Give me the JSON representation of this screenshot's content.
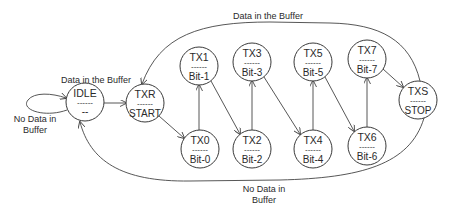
{
  "diagram": {
    "type": "state-machine",
    "nodes": [
      {
        "id": "IDLE",
        "label": "IDLE",
        "sub": "--",
        "sep": "------",
        "cx": 85,
        "cy": 102
      },
      {
        "id": "TXR",
        "label": "TXR",
        "sub": "START",
        "sep": "------",
        "cx": 145,
        "cy": 103
      },
      {
        "id": "TX0",
        "label": "TX0",
        "sub": "Bit-0",
        "sep": "------",
        "cx": 200,
        "cy": 149
      },
      {
        "id": "TX1",
        "label": "TX1",
        "sub": "Bit-1",
        "sep": "------",
        "cx": 199,
        "cy": 66
      },
      {
        "id": "TX2",
        "label": "TX2",
        "sub": "Bit-2",
        "sep": "------",
        "cx": 252,
        "cy": 149
      },
      {
        "id": "TX3",
        "label": "TX3",
        "sub": "Bit-3",
        "sep": "------",
        "cx": 252,
        "cy": 62
      },
      {
        "id": "TX4",
        "label": "TX4",
        "sub": "Bit-4",
        "sep": "------",
        "cx": 313,
        "cy": 149
      },
      {
        "id": "TX5",
        "label": "TX5",
        "sub": "Bit-5",
        "sep": "------",
        "cx": 313,
        "cy": 62
      },
      {
        "id": "TX6",
        "label": "TX6",
        "sub": "Bit-6",
        "sep": "------",
        "cx": 367,
        "cy": 146
      },
      {
        "id": "TX7",
        "label": "TX7",
        "sub": "Bit-7",
        "sep": "------",
        "cx": 367,
        "cy": 59
      },
      {
        "id": "TXS",
        "label": "TXS",
        "sub": "STOP",
        "sep": "------",
        "cx": 418,
        "cy": 100
      }
    ],
    "edges": [
      {
        "from": "IDLE",
        "to": "IDLE",
        "label": "No Data in Buffer"
      },
      {
        "from": "IDLE",
        "to": "TXR",
        "label": "Data in the Buffer"
      },
      {
        "from": "TXR",
        "to": "TX0",
        "label": ""
      },
      {
        "from": "TX0",
        "to": "TX1",
        "label": ""
      },
      {
        "from": "TX1",
        "to": "TX2",
        "label": ""
      },
      {
        "from": "TX2",
        "to": "TX3",
        "label": ""
      },
      {
        "from": "TX3",
        "to": "TX4",
        "label": ""
      },
      {
        "from": "TX4",
        "to": "TX5",
        "label": ""
      },
      {
        "from": "TX5",
        "to": "TX6",
        "label": ""
      },
      {
        "from": "TX6",
        "to": "TX7",
        "label": ""
      },
      {
        "from": "TX7",
        "to": "TXS",
        "label": ""
      },
      {
        "from": "TXS",
        "to": "TXR",
        "label": "Data in the Buffer"
      },
      {
        "from": "TXS",
        "to": "IDLE",
        "label": "No Data in Buffer"
      }
    ],
    "labels": {
      "idle_to_txr": "Data in the Buffer",
      "idle_self_line1": "No Data in",
      "idle_self_line2": "Buffer",
      "txs_to_txr": "Data in the Buffer",
      "txs_to_idle_line1": "No Data in",
      "txs_to_idle_line2": "Buffer"
    }
  }
}
